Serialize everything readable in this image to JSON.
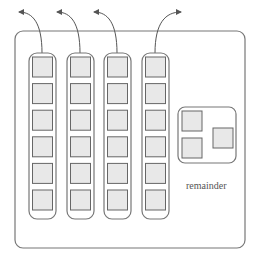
{
  "diagram": {
    "outer_frame": {
      "x": 15,
      "y": 31,
      "w": 230,
      "h": 217,
      "rx": 8
    },
    "columns": [
      {
        "x": 29,
        "cells": 6
      },
      {
        "x": 67,
        "cells": 6
      },
      {
        "x": 104,
        "cells": 6
      },
      {
        "x": 142,
        "cells": 6
      }
    ],
    "column_style": {
      "y": 53,
      "w": 27,
      "h": 166,
      "rx": 8
    },
    "cell_style": {
      "w": 20,
      "h": 20,
      "first_y": 57,
      "pitch": 26.6,
      "x_offset": 3.5
    },
    "remainder": {
      "label": "remainder",
      "box": {
        "x": 178,
        "y": 107,
        "w": 58,
        "h": 56,
        "rx": 7
      },
      "cells": [
        {
          "x": 182,
          "y": 111
        },
        {
          "x": 182,
          "y": 138
        },
        {
          "x": 213,
          "y": 128
        }
      ]
    },
    "arrows": [
      {
        "from_x": 42,
        "to_x": 19
      },
      {
        "from_x": 80,
        "to_x": 57
      },
      {
        "from_x": 117,
        "to_x": 94
      },
      {
        "from_x": 155,
        "to_x": 181
      }
    ],
    "colors": {
      "stroke": "#777777",
      "cell_fill": "#e8e8e8",
      "cell_stroke": "#666666",
      "label": "#555555"
    }
  }
}
